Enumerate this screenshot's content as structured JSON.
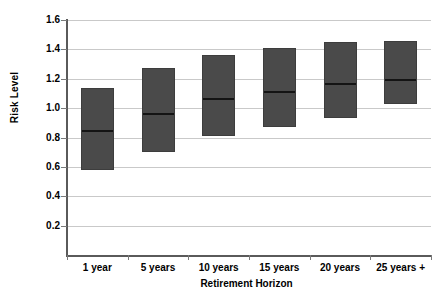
{
  "chart_data": {
    "type": "bar",
    "title": "",
    "xlabel": "Retirement Horizon",
    "ylabel": "Risk Level",
    "categories": [
      "1 year",
      "5 years",
      "10 years",
      "15 years",
      "20 years",
      "25 years +"
    ],
    "series": [
      {
        "name": "low",
        "values": [
          0.58,
          0.7,
          0.81,
          0.87,
          0.93,
          1.03
        ]
      },
      {
        "name": "median",
        "values": [
          0.85,
          0.97,
          1.07,
          1.12,
          1.17,
          1.2
        ]
      },
      {
        "name": "high",
        "values": [
          1.14,
          1.27,
          1.36,
          1.41,
          1.45,
          1.46
        ]
      }
    ],
    "ylim": [
      0,
      1.6
    ],
    "ytick_labels": [
      "1.6",
      "1.4",
      "1.2",
      "1.0",
      "0.8",
      "0.6",
      "0.4",
      "0.2"
    ],
    "ytick_values": [
      1.6,
      1.4,
      1.2,
      1.0,
      0.8,
      0.6,
      0.4,
      0.2
    ],
    "grid": true,
    "legend": "none",
    "bar_color": "#4a4a4a",
    "median_color": "#141414",
    "gridline_color": "#c9c9c9",
    "axis_color": "#5a5a5a",
    "background_color": "#ffffff"
  }
}
